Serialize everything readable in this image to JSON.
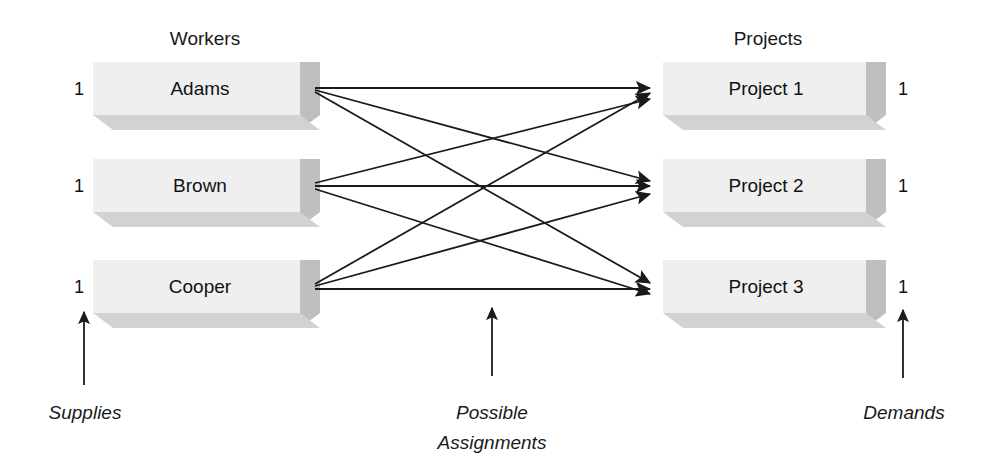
{
  "diagram": {
    "title_left": "Workers",
    "title_right": "Projects",
    "workers": [
      {
        "label": "Adams",
        "supply": "1"
      },
      {
        "label": "Brown",
        "supply": "1"
      },
      {
        "label": "Cooper",
        "supply": "1"
      }
    ],
    "projects": [
      {
        "label": "Project 1",
        "demand": "1"
      },
      {
        "label": "Project 2",
        "demand": "1"
      },
      {
        "label": "Project 3",
        "demand": "1"
      }
    ],
    "captions": {
      "supplies": "Supplies",
      "assignments_line1": "Possible",
      "assignments_line2": "Assignments",
      "demands": "Demands"
    },
    "colors": {
      "box_front": "#efefef",
      "box_side": "#bfbfbf",
      "box_bottom": "#d2d2d2",
      "line": "#1a1a1a",
      "text": "#111111",
      "background": "#ffffff"
    },
    "edges": [
      {
        "from": "Adams",
        "to": "Project 1"
      },
      {
        "from": "Adams",
        "to": "Project 2"
      },
      {
        "from": "Adams",
        "to": "Project 3"
      },
      {
        "from": "Brown",
        "to": "Project 1"
      },
      {
        "from": "Brown",
        "to": "Project 2"
      },
      {
        "from": "Brown",
        "to": "Project 3"
      },
      {
        "from": "Cooper",
        "to": "Project 1"
      },
      {
        "from": "Cooper",
        "to": "Project 2"
      },
      {
        "from": "Cooper",
        "to": "Project 3"
      }
    ]
  }
}
